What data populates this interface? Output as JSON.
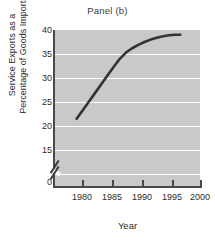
{
  "chart_data": {
    "type": "line",
    "title": "Panel (b)",
    "xlabel": "Year",
    "ylabel": "Service Exports as a Percentage of Goods Imports",
    "ylabel_lines": [
      "Service Exports as a",
      "Percentage of Goods Imports"
    ],
    "xlim": [
      1976.5,
      2000
    ],
    "ylim": [
      15,
      40
    ],
    "y_axis_break": true,
    "y_axis_break_note": "axis broken between 0 and 15",
    "grid": true,
    "grid_axis": "y",
    "legend": "none",
    "xticks": [
      1980,
      1985,
      1990,
      1995,
      2000
    ],
    "xtick_labels": [
      "1980",
      "1985",
      "1990",
      "1995",
      "2000"
    ],
    "yticks": [
      0,
      15,
      20,
      25,
      30,
      35,
      40
    ],
    "ytick_labels": [
      "0",
      "15",
      "20",
      "25",
      "30",
      "35",
      "40"
    ],
    "series": [
      {
        "name": "Service Exports as a Percentage of Goods Imports",
        "x": [
          1980,
          1981,
          1982,
          1983,
          1984,
          1985,
          1986,
          1987,
          1988,
          1989,
          1990,
          1991,
          1992,
          1993,
          1994,
          1995,
          1996,
          1996.8
        ],
        "values": [
          21.5,
          23.3,
          25.1,
          26.9,
          28.7,
          30.5,
          32.3,
          34.0,
          35.3,
          36.2,
          36.9,
          37.5,
          38.0,
          38.4,
          38.7,
          38.9,
          39.0,
          39.0
        ]
      }
    ],
    "colors": {
      "plot_background": "#c9c9c9",
      "gridline": "#ffffff",
      "curve": "#333333",
      "axis": "#4a4a4a",
      "text": "#2b2b2b",
      "page_background": "#ffffff"
    }
  }
}
